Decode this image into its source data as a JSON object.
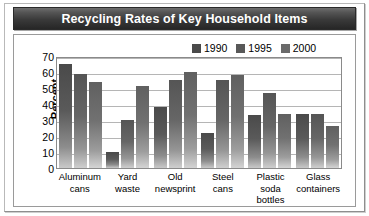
{
  "title": "Recycling Rates of Key Household Items",
  "chart_data": {
    "type": "bar",
    "title": "Recycling Rates of Key Household Items",
    "xlabel": "",
    "ylabel": "Percent",
    "ylim": [
      0,
      70
    ],
    "yticks": [
      70,
      60,
      50,
      40,
      30,
      20,
      10,
      0
    ],
    "grid": true,
    "legend_position": "top-right",
    "categories": [
      "Aluminum cans",
      "Yard waste",
      "Old newsprint",
      "Steel cans",
      "Plastic soda bottles",
      "Glass containers"
    ],
    "category_lines": [
      [
        "Aluminum",
        "cans"
      ],
      [
        "Yard",
        "waste"
      ],
      [
        "Old",
        "newsprint"
      ],
      [
        "Steel",
        "cans"
      ],
      [
        "Plastic soda",
        "bottles"
      ],
      [
        "Glass",
        "containers"
      ]
    ],
    "series": [
      {
        "name": "1990",
        "color": "#4a4a4a",
        "values": [
          65,
          10,
          38,
          22,
          33,
          34
        ]
      },
      {
        "name": "1995",
        "color": "#585858",
        "values": [
          59,
          30,
          55,
          55,
          47,
          34
        ]
      },
      {
        "name": "2000",
        "color": "#6a6a6a",
        "values": [
          54,
          51,
          60,
          58,
          34,
          26
        ]
      }
    ]
  }
}
